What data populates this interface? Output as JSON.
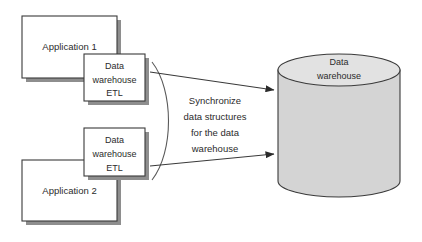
{
  "diagram": {
    "background_color": "#ffffff",
    "canvas": {
      "width": 422,
      "height": 242
    },
    "palette": {
      "box_fill": "#ffffff",
      "box_stroke": "#3a3a3a",
      "box_shadow": "#8e8e8e",
      "cylinder_body_fill": "#d4d4d4",
      "cylinder_top_fill": "#e2e2e2",
      "text_color": "#2b2b2b",
      "connector_color": "#3a3a3a"
    },
    "nodes": {
      "application_1": {
        "label": "Application 1"
      },
      "application_2": {
        "label": "Application 2"
      },
      "etl_1": {
        "line1": "Data",
        "line2": "warehouse",
        "line3": "ETL"
      },
      "etl_2": {
        "line1": "Data",
        "line2": "warehouse",
        "line3": "ETL"
      },
      "warehouse_cylinder": {
        "line1": "Data",
        "line2": "warehouse"
      }
    },
    "caption": {
      "line1": "Synchronize",
      "line2": "data structures",
      "line3": "for the data",
      "line4": "warehouse"
    },
    "connectors": [
      {
        "name": "etl-1-to-warehouse",
        "from": "etl_1",
        "to": "warehouse_cylinder",
        "arrow": "end"
      },
      {
        "name": "etl-2-to-warehouse",
        "from": "etl_2",
        "to": "warehouse_cylinder",
        "arrow": "end"
      }
    ]
  }
}
